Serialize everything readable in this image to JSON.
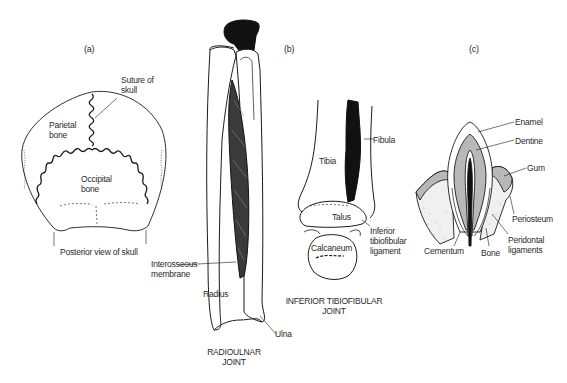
{
  "figure": {
    "panels": [
      {
        "id": "a",
        "panel_label": "(a)",
        "caption": "Posterior view of skull",
        "labels": {
          "suture": [
            "Suture of",
            "skull"
          ],
          "parietal": [
            "Parietal",
            "bone"
          ],
          "occipital": [
            "Occipital",
            "bone"
          ]
        }
      },
      {
        "id": "radioulnar",
        "caption": [
          "RADIOULNAR",
          "JOINT"
        ],
        "labels": {
          "interosseous": [
            "Interosseous",
            "membrane"
          ],
          "radius": "Radius",
          "ulna": "Ulna"
        }
      },
      {
        "id": "b",
        "panel_label": "(b)",
        "caption": [
          "INFERIOR TIBIOFIBULAR",
          "JOINT"
        ],
        "labels": {
          "fibula": "Fibula",
          "tibia": "Tibia",
          "talus": "Talus",
          "calcaneum": "Calcaneum",
          "ligament": [
            "Inferior",
            "tibiofibular",
            "ligament"
          ]
        }
      },
      {
        "id": "c",
        "panel_label": "(c)",
        "labels": {
          "enamel": "Enamel",
          "dentine": "Dentine",
          "gum": "Gum",
          "periosteum": "Periosteum",
          "cementum": "Cementum",
          "bone": "Bone",
          "peridontal": [
            "Peridontal",
            "ligaments"
          ]
        }
      }
    ],
    "colors": {
      "line": "#1a1a1a",
      "shade": "#b8b8b8",
      "dark": "#111111",
      "stipple": "#9a9a9a"
    }
  }
}
